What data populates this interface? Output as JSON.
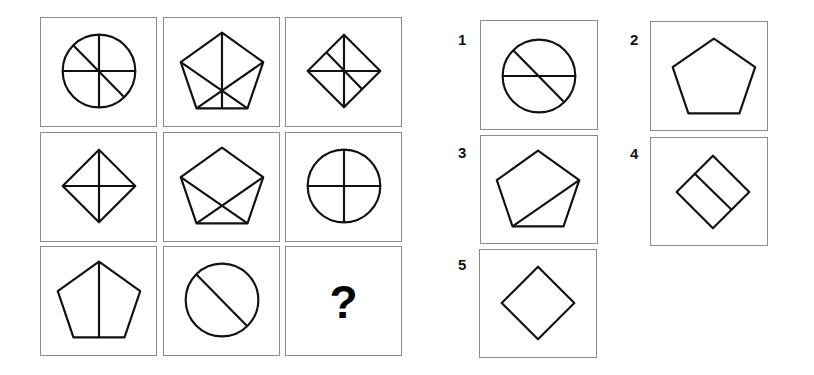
{
  "puzzle": {
    "matrix": [
      {
        "row": 1,
        "col": 1,
        "shape": "circle",
        "lines": [
          "vertical",
          "horizontal",
          "diagonal"
        ]
      },
      {
        "row": 1,
        "col": 2,
        "shape": "pentagon",
        "lines": [
          "vertical",
          "diagonal-left",
          "diagonal-right"
        ]
      },
      {
        "row": 1,
        "col": 3,
        "shape": "diamond",
        "lines": [
          "vertical",
          "horizontal",
          "diagonal"
        ]
      },
      {
        "row": 2,
        "col": 1,
        "shape": "diamond",
        "lines": [
          "vertical",
          "horizontal"
        ]
      },
      {
        "row": 2,
        "col": 2,
        "shape": "pentagon",
        "lines": [
          "diagonal-left",
          "diagonal-right"
        ]
      },
      {
        "row": 2,
        "col": 3,
        "shape": "circle",
        "lines": [
          "vertical",
          "horizontal"
        ]
      },
      {
        "row": 3,
        "col": 1,
        "shape": "pentagon",
        "lines": [
          "vertical"
        ]
      },
      {
        "row": 3,
        "col": 2,
        "shape": "circle",
        "lines": [
          "diagonal"
        ]
      },
      {
        "row": 3,
        "col": 3,
        "shape": "missing",
        "label": "?"
      }
    ],
    "options": [
      {
        "label": "1",
        "shape": "circle",
        "lines": [
          "horizontal",
          "diagonal"
        ]
      },
      {
        "label": "2",
        "shape": "pentagon",
        "lines": []
      },
      {
        "label": "3",
        "shape": "pentagon",
        "lines": [
          "diagonal"
        ]
      },
      {
        "label": "4",
        "shape": "diamond",
        "lines": [
          "diagonal"
        ]
      },
      {
        "label": "5",
        "shape": "diamond",
        "lines": []
      }
    ],
    "question_mark": "?"
  }
}
